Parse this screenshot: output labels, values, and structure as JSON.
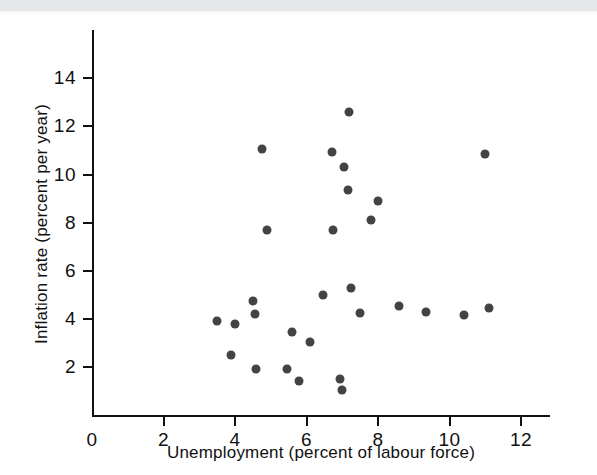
{
  "figure": {
    "background_color": "#ffffff",
    "axis_color": "#111111",
    "marker_color": "#434343",
    "scan_band_color": "#e6e7e9"
  },
  "chart_data": {
    "type": "scatter",
    "title": "",
    "xlabel": "Unemployment (percent of labour force)",
    "ylabel": "Inflation rate (percent per year)",
    "xlim": [
      0,
      13
    ],
    "ylim": [
      0,
      16
    ],
    "xticks": [
      0,
      2,
      4,
      6,
      8,
      10,
      12
    ],
    "xticklabels": [
      "0",
      "2",
      "4",
      "6",
      "8",
      "10",
      "12"
    ],
    "yticks": [
      2,
      4,
      6,
      8,
      10,
      12,
      14
    ],
    "yticklabels": [
      "2",
      "4",
      "6",
      "8",
      "10",
      "12",
      "14"
    ],
    "grid": false,
    "legend": null,
    "points": [
      {
        "x": 3.5,
        "y": 3.9
      },
      {
        "x": 3.9,
        "y": 2.5
      },
      {
        "x": 4.0,
        "y": 3.8
      },
      {
        "x": 4.5,
        "y": 4.75
      },
      {
        "x": 4.55,
        "y": 4.2
      },
      {
        "x": 4.6,
        "y": 1.9
      },
      {
        "x": 4.75,
        "y": 11.05
      },
      {
        "x": 4.9,
        "y": 7.7
      },
      {
        "x": 5.45,
        "y": 1.9
      },
      {
        "x": 5.6,
        "y": 3.45
      },
      {
        "x": 5.8,
        "y": 1.4
      },
      {
        "x": 6.1,
        "y": 3.05
      },
      {
        "x": 6.45,
        "y": 5.0
      },
      {
        "x": 6.7,
        "y": 10.95
      },
      {
        "x": 6.75,
        "y": 7.7
      },
      {
        "x": 6.95,
        "y": 1.5
      },
      {
        "x": 7.0,
        "y": 1.05
      },
      {
        "x": 7.05,
        "y": 10.3
      },
      {
        "x": 7.15,
        "y": 9.35
      },
      {
        "x": 7.2,
        "y": 12.6
      },
      {
        "x": 7.25,
        "y": 5.3
      },
      {
        "x": 7.5,
        "y": 4.25
      },
      {
        "x": 7.8,
        "y": 8.1
      },
      {
        "x": 8.0,
        "y": 8.9
      },
      {
        "x": 8.6,
        "y": 4.55
      },
      {
        "x": 9.35,
        "y": 4.3
      },
      {
        "x": 10.4,
        "y": 4.15
      },
      {
        "x": 11.0,
        "y": 10.85
      },
      {
        "x": 11.1,
        "y": 4.45
      }
    ]
  }
}
